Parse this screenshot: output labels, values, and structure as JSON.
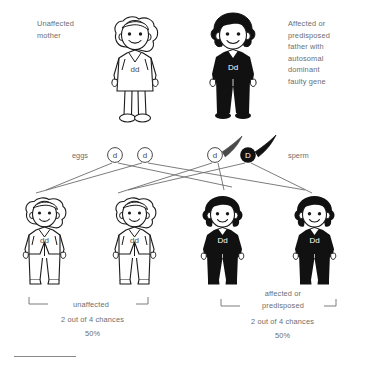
{
  "diagram": {
    "title_alt": "Autosomal dominant inheritance pattern",
    "colors": {
      "text": "#6d6d6d",
      "outline": "#1a1a1a",
      "affected_fill": "#111111",
      "unaffected_fill": "#ffffff",
      "line": "#6d6d6d",
      "rule": "#8a8a8a"
    }
  },
  "parents": {
    "mother": {
      "caption": "Unaffected\nmother",
      "genotype": "dd",
      "status": "unaffected"
    },
    "father": {
      "caption": "Affected or\npredisposed\nfather with\nautosomal\ndominant\nfaulty gene",
      "genotype": "Dd",
      "status": "affected"
    }
  },
  "gametes": {
    "eggs_label": "eggs",
    "sperm_label": "sperm",
    "eggs": [
      {
        "allele": "d",
        "type": "unaffected"
      },
      {
        "allele": "d",
        "type": "unaffected"
      }
    ],
    "sperm": [
      {
        "allele": "d",
        "type": "unaffected"
      },
      {
        "allele": "D",
        "type": "affected"
      }
    ]
  },
  "children": [
    {
      "genotype": "dd",
      "status": "unaffected"
    },
    {
      "genotype": "dd",
      "status": "unaffected"
    },
    {
      "genotype": "Dd",
      "status": "affected"
    },
    {
      "genotype": "Dd",
      "status": "affected"
    }
  ],
  "outcomes": [
    {
      "label": "unaffected",
      "chances": "2 out of 4 chances",
      "percent": "50%"
    },
    {
      "label": "affected or\npredisposed",
      "chances": "2 out of 4 chances",
      "percent": "50%"
    }
  ]
}
